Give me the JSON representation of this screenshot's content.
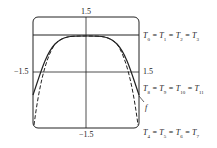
{
  "figure": {
    "axis_labels": {
      "top": "1.5",
      "bottom": "−1.5",
      "left": "−1.5",
      "right": "1.5"
    },
    "equations": {
      "upper": [
        "T",
        "0",
        " = ",
        "T",
        "1",
        " = ",
        "T",
        "2",
        " = ",
        "T",
        "3"
      ],
      "middle": [
        "T",
        "8",
        " = ",
        "T",
        "9",
        " = ",
        "T",
        "10",
        " = ",
        "T",
        "11"
      ],
      "lower": [
        "T",
        "4",
        " = ",
        "T",
        "5",
        " = ",
        "T",
        "6",
        " = ",
        "T",
        "7"
      ]
    },
    "curve_label": "f",
    "colors": {
      "line": "#222222",
      "background": "#ffffff"
    }
  }
}
